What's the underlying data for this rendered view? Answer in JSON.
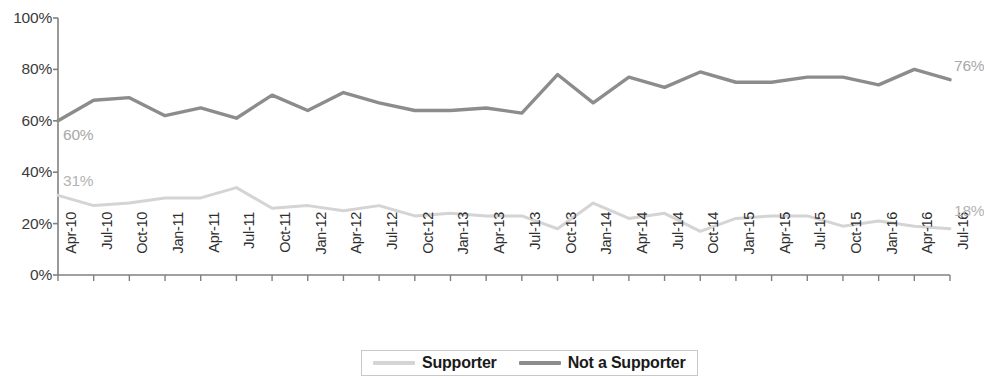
{
  "chart_data": {
    "type": "line",
    "title": "",
    "xlabel": "",
    "ylabel": "",
    "ylim": [
      0,
      100
    ],
    "yticks": [
      "0%",
      "20%",
      "40%",
      "60%",
      "80%",
      "100%"
    ],
    "ytick_values": [
      0,
      20,
      40,
      60,
      80,
      100
    ],
    "grid": false,
    "legend_position": "bottom-center",
    "x": [
      "Apr-10",
      "Jul-10",
      "Oct-10",
      "Jan-11",
      "Apr-11",
      "Jul-11",
      "Oct-11",
      "Jan-12",
      "Apr-12",
      "Jul-12",
      "Oct-12",
      "Jan-13",
      "Apr-13",
      "Jul-13",
      "Oct-13",
      "Jan-14",
      "Apr-14",
      "Jul-14",
      "Oct-14",
      "Jan-15",
      "Apr-15",
      "Jul-15",
      "Oct-15",
      "Jan-16",
      "Apr-16",
      "Jul-16"
    ],
    "series": [
      {
        "name": "Supporter",
        "color": "#d4d4d4",
        "values": [
          31,
          27,
          28,
          30,
          30,
          34,
          26,
          27,
          25,
          27,
          23,
          24,
          23,
          23,
          18,
          28,
          22,
          24,
          17,
          22,
          23,
          23,
          19,
          21,
          19,
          18
        ],
        "start_label": "31%",
        "end_label": "18%"
      },
      {
        "name": "Not a Supporter",
        "color": "#8c8c8c",
        "values": [
          60,
          68,
          69,
          62,
          65,
          61,
          70,
          64,
          71,
          67,
          64,
          64,
          65,
          63,
          78,
          67,
          77,
          73,
          79,
          75,
          75,
          77,
          77,
          74,
          80,
          76
        ],
        "start_label": "60%",
        "end_label": "76%"
      }
    ]
  },
  "legend": {
    "items": [
      {
        "label": "Supporter",
        "color": "#d4d4d4"
      },
      {
        "label": "Not a Supporter",
        "color": "#8c8c8c"
      }
    ]
  },
  "axis": {
    "line_color": "#808080"
  }
}
